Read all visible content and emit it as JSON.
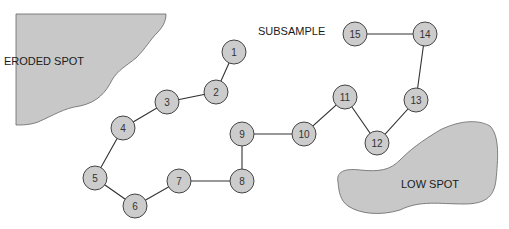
{
  "diagram": {
    "title": "SUBSAMPLE",
    "regions": [
      {
        "label": "ERODED SPOT",
        "fill": "#c8c8c8"
      },
      {
        "label": "LOW SPOT",
        "fill": "#c8c8c8"
      }
    ],
    "node_fill": "#cccccc",
    "nodes": [
      {
        "id": "1",
        "x": 234,
        "y": 52
      },
      {
        "id": "2",
        "x": 216,
        "y": 92
      },
      {
        "id": "3",
        "x": 167,
        "y": 102
      },
      {
        "id": "4",
        "x": 123,
        "y": 128
      },
      {
        "id": "5",
        "x": 95,
        "y": 178
      },
      {
        "id": "6",
        "x": 135,
        "y": 206
      },
      {
        "id": "7",
        "x": 179,
        "y": 181
      },
      {
        "id": "8",
        "x": 242,
        "y": 181
      },
      {
        "id": "9",
        "x": 242,
        "y": 134
      },
      {
        "id": "10",
        "x": 304,
        "y": 134
      },
      {
        "id": "11",
        "x": 345,
        "y": 97
      },
      {
        "id": "12",
        "x": 377,
        "y": 143
      },
      {
        "id": "13",
        "x": 416,
        "y": 100
      },
      {
        "id": "14",
        "x": 425,
        "y": 34
      },
      {
        "id": "15",
        "x": 355,
        "y": 34
      }
    ]
  }
}
